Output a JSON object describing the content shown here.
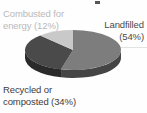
{
  "figure": {
    "background_color": "#fefefe",
    "rule_color": "#e3e3e3",
    "crop_fragment_color": "#3a3a3a"
  },
  "labels": {
    "combusted": {
      "line1": "Combusted for",
      "line2": "energy (12%)",
      "color": "#b9b9b9"
    },
    "landfilled": {
      "line1": "Landfilled",
      "line2": "(54%)",
      "color": "#4a4a4a"
    },
    "recycled": {
      "line1": "Recycled or",
      "line2": "composted (34%)",
      "color": "#3c3c3c"
    }
  },
  "chart_data": {
    "type": "pie",
    "title": "",
    "subtitle": "",
    "xlabel": "",
    "ylabel": "",
    "legend_position": "none",
    "grid": false,
    "three_d": true,
    "labels_outside": true,
    "categories": [
      "Landfilled",
      "Recycled or composted",
      "Combusted for energy"
    ],
    "values": [
      54,
      34,
      12
    ],
    "units": "percent",
    "slices": [
      {
        "name": "Landfilled",
        "value": 54,
        "label": "Landfilled (54%)",
        "color": "#7d7d7d",
        "side_color": "#454545",
        "start_angle_deg": 0,
        "end_angle_deg": 194.4
      },
      {
        "name": "Recycled or composted",
        "value": 34,
        "label": "Recycled or composted (34%)",
        "color": "#4a4a4a",
        "side_color": "#2a2a2a",
        "start_angle_deg": 194.4,
        "end_angle_deg": 316.8
      },
      {
        "name": "Combusted for energy",
        "value": 12,
        "label": "Combusted for energy (12%)",
        "color": "#c9c9c9",
        "side_color": "#8f8f8f",
        "start_angle_deg": 316.8,
        "end_angle_deg": 360
      }
    ]
  }
}
